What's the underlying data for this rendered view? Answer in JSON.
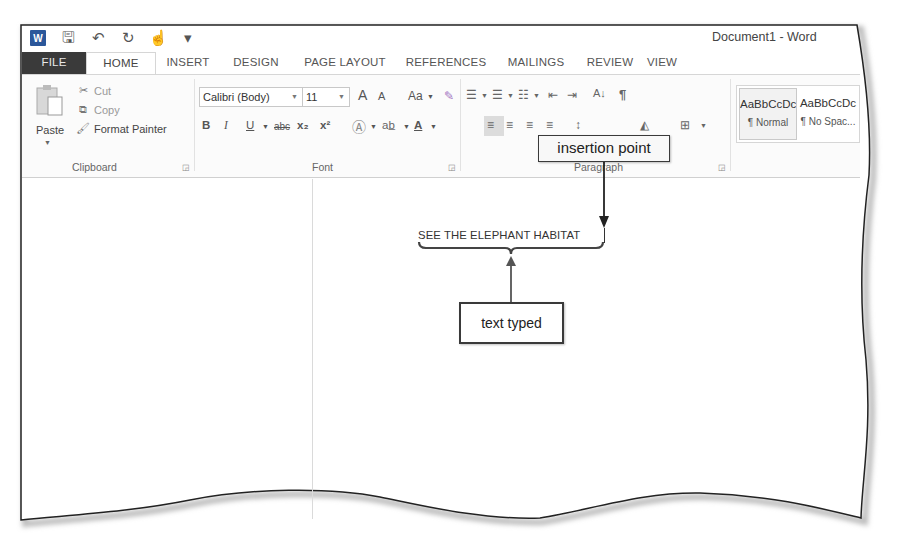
{
  "window": {
    "title": "Document1 - Word",
    "app_icon": "word-logo-icon"
  },
  "quick_access": [
    {
      "name": "save-icon",
      "glyph": "🖫"
    },
    {
      "name": "undo-icon",
      "glyph": "↶"
    },
    {
      "name": "redo-icon",
      "glyph": "↻"
    },
    {
      "name": "touch-mode-icon",
      "glyph": "☝"
    },
    {
      "name": "customize-icon",
      "glyph": "▾"
    }
  ],
  "tabs": [
    {
      "label": "FILE",
      "active": false
    },
    {
      "label": "HOME",
      "active": true
    },
    {
      "label": "INSERT",
      "active": false
    },
    {
      "label": "DESIGN",
      "active": false
    },
    {
      "label": "PAGE LAYOUT",
      "active": false
    },
    {
      "label": "REFERENCES",
      "active": false
    },
    {
      "label": "MAILINGS",
      "active": false
    },
    {
      "label": "REVIEW",
      "active": false
    },
    {
      "label": "VIEW",
      "active": false
    }
  ],
  "ribbon": {
    "clipboard": {
      "label": "Clipboard",
      "paste": "Paste",
      "cut": "Cut",
      "copy": "Copy",
      "format_painter": "Format Painter"
    },
    "font": {
      "label": "Font",
      "font_name": "Calibri (Body)",
      "font_size": "11",
      "grow": "A",
      "shrink": "A",
      "change_case": "Aa",
      "bold": "B",
      "italic": "I",
      "underline": "U",
      "strikethrough": "abc",
      "subscript": "x₂",
      "superscript": "x²"
    },
    "paragraph": {
      "label": "Paragraph",
      "show_hide": "¶",
      "sort": "A↓"
    },
    "styles": {
      "items": [
        {
          "sample": "AaBbCcDc",
          "name": "¶ Normal"
        },
        {
          "sample": "AaBbCcDc",
          "name": "¶ No Spac..."
        }
      ]
    }
  },
  "document": {
    "text": "SEE THE ELEPHANT HABITAT"
  },
  "callouts": {
    "insertion_point": "insertion point",
    "text_typed": "text typed"
  }
}
